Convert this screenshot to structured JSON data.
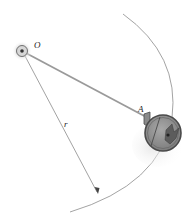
{
  "figure": {
    "labels": {
      "pivot": "O",
      "ball_attach": "A",
      "radius": "r"
    },
    "colors": {
      "rod": "#9a9a9a",
      "arc": "#8c8c8c",
      "ball_fill": "#8e8e8e",
      "ball_rim": "#4a4a4a",
      "pivot_glow": "#cfcfcf",
      "text": "#222222"
    }
  }
}
